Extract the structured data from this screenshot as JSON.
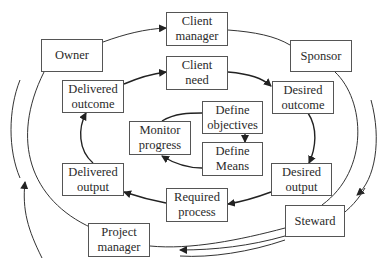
{
  "diagram": {
    "title": "",
    "colors": {
      "line": "#333333",
      "box_border": "#555555",
      "text": "#2a2a2a",
      "background": "#ffffff"
    },
    "outer_ring": [
      {
        "id": "owner",
        "label": "Owner"
      },
      {
        "id": "client_manager",
        "label": "Client\nmanager"
      },
      {
        "id": "sponsor",
        "label": "Sponsor"
      },
      {
        "id": "steward",
        "label": "Steward"
      },
      {
        "id": "project_manager",
        "label": "Project\nmanager"
      }
    ],
    "middle_ring": [
      {
        "id": "client_need",
        "label": "Client\nneed"
      },
      {
        "id": "desired_outcome",
        "label": "Desired\noutcome"
      },
      {
        "id": "desired_output",
        "label": "Desired\noutput"
      },
      {
        "id": "required_process",
        "label": "Required\nprocess"
      },
      {
        "id": "delivered_output",
        "label": "Delivered\noutput"
      },
      {
        "id": "delivered_outcome",
        "label": "Delivered\noutcome"
      }
    ],
    "inner_ring": [
      {
        "id": "define_objectives",
        "label": "Define\nobjectives"
      },
      {
        "id": "define_means",
        "label": "Define\nMeans"
      },
      {
        "id": "monitor_progress",
        "label": "Monitor\nprogress"
      }
    ],
    "edges": [
      {
        "from": "owner",
        "to": "client_manager",
        "arrow": true
      },
      {
        "from": "client_manager",
        "to": "sponsor",
        "arrow": false
      },
      {
        "from": "sponsor",
        "to": "steward",
        "arrow": false
      },
      {
        "from": "steward",
        "to": "project_manager",
        "arrow": false
      },
      {
        "from": "project_manager",
        "to": "owner",
        "arrow": false
      },
      {
        "from": "client_need",
        "to": "desired_outcome",
        "arrow": true
      },
      {
        "from": "desired_outcome",
        "to": "desired_output",
        "arrow": true
      },
      {
        "from": "desired_output",
        "to": "required_process",
        "arrow": true
      },
      {
        "from": "required_process",
        "to": "delivered_output",
        "arrow": true
      },
      {
        "from": "delivered_output",
        "to": "delivered_outcome",
        "arrow": true
      },
      {
        "from": "delivered_outcome",
        "to": "client_need",
        "arrow": true
      },
      {
        "from": "define_objectives",
        "to": "define_means",
        "arrow": true
      },
      {
        "from": "define_means",
        "to": "monitor_progress",
        "arrow": true
      },
      {
        "from": "monitor_progress",
        "to": "define_objectives",
        "arrow": false
      }
    ],
    "flow_indicators": [
      "right-side-clockwise-arrow",
      "bottom-leftward-arrow",
      "left-side-upward-arrow"
    ]
  }
}
